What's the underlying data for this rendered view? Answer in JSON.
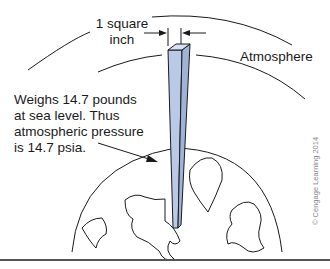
{
  "diagram": {
    "labels": {
      "square_inch_line1": "1 square",
      "square_inch_line2": "inch",
      "atmosphere": "Atmosphere",
      "weight_line1": "Weighs 14.7 pounds",
      "weight_line2": "at sea level. Thus",
      "weight_line3": "atmospheric pressure",
      "weight_line4": "is 14.7 psia."
    },
    "copyright": "© Cengage Learning 2014",
    "colors": {
      "column_fill": "#b9c9e6",
      "column_side": "#9fb3d8",
      "line": "#1a1a1a"
    }
  }
}
